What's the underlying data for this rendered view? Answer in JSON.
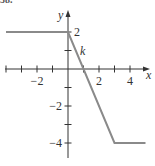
{
  "header": {
    "label": "58."
  },
  "chart_data": {
    "type": "line",
    "title": "",
    "function_label": "k",
    "xlabel": "x",
    "ylabel": "y",
    "xlim": [
      -4.2,
      5
    ],
    "ylim": [
      -5,
      3
    ],
    "grid": false,
    "x_ticks": [
      -4,
      -3,
      -2,
      -1,
      1,
      2,
      3,
      4
    ],
    "x_tick_labels": [
      "-2",
      "2",
      "4"
    ],
    "x_tick_label_values": [
      -2,
      2,
      4
    ],
    "y_ticks": [
      -4,
      -3,
      -2,
      -1,
      1,
      2
    ],
    "y_tick_labels": [
      "2",
      "-2",
      "-4"
    ],
    "y_tick_label_values": [
      2,
      -2,
      -4
    ],
    "series": [
      {
        "name": "k",
        "x": [
          -4,
          0,
          3,
          5
        ],
        "y": [
          2,
          2,
          -4,
          -4
        ]
      }
    ],
    "line_color": "#8a8a8a",
    "axis_color": "#333333"
  }
}
